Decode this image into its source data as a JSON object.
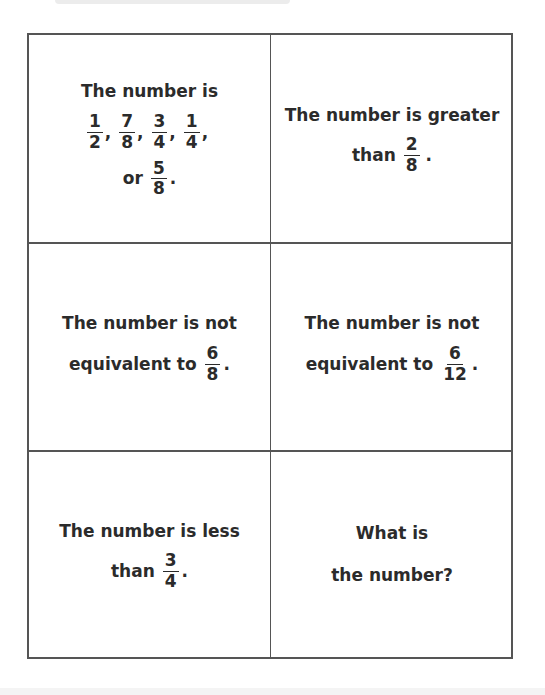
{
  "cards": [
    {
      "line1": "The number is",
      "fractions": [
        {
          "num": "1",
          "den": "2",
          "sep": ","
        },
        {
          "num": "7",
          "den": "8",
          "sep": ","
        },
        {
          "num": "3",
          "den": "4",
          "sep": ","
        },
        {
          "num": "1",
          "den": "4",
          "sep": ","
        }
      ],
      "prefix3": "or",
      "last_fraction": {
        "num": "5",
        "den": "8"
      },
      "end": "."
    },
    {
      "line1": "The number is greater",
      "prefix2": "than",
      "fraction": {
        "num": "2",
        "den": "8"
      },
      "end": "."
    },
    {
      "line1": "The number is not",
      "prefix2": "equivalent to",
      "fraction": {
        "num": "6",
        "den": "8"
      },
      "end": "."
    },
    {
      "line1": "The number is not",
      "prefix2": "equivalent to",
      "fraction": {
        "num": "6",
        "den": "12"
      },
      "end": "."
    },
    {
      "line1": "The number is less",
      "prefix2": "than",
      "fraction": {
        "num": "3",
        "den": "4"
      },
      "end": "."
    },
    {
      "line1": "What is",
      "line2": "the number?"
    }
  ]
}
